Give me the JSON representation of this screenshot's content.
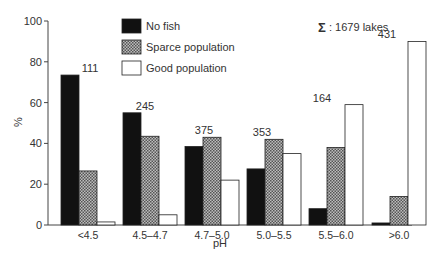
{
  "chart_data": {
    "type": "bar",
    "title": "",
    "xlabel": "pH",
    "ylabel": "%",
    "ylim": [
      0,
      100
    ],
    "yticks": [
      0,
      20,
      40,
      60,
      80,
      100
    ],
    "categories": [
      "<4.5",
      "4.5–4.7",
      "4.7–5.0",
      "5.0–5.5",
      "5.5–6.0",
      ">6.0"
    ],
    "group_totals": [
      111,
      245,
      375,
      353,
      164,
      431
    ],
    "series": [
      {
        "name": "No fish",
        "fill": "#111111",
        "pattern": "solid",
        "values": [
          73.5,
          55,
          38.5,
          27.5,
          8,
          1
        ]
      },
      {
        "name": "Sparce population",
        "fill": "#888888",
        "pattern": "dotted",
        "values": [
          26.5,
          43.5,
          43,
          42,
          38,
          14
        ]
      },
      {
        "name": "Good population",
        "fill": "#ffffff",
        "pattern": "outline",
        "values": [
          1.5,
          5,
          22,
          35,
          59,
          90
        ]
      }
    ],
    "annotation": "Σ: 1679 lakes",
    "grid": false,
    "legend_position": "top-center"
  },
  "legend": {
    "items": [
      "No fish",
      "Sparce population",
      "Good population"
    ]
  },
  "annotation": {
    "sigma": "Σ",
    "text": ": 1679 lakes"
  },
  "axes": {
    "xlabel": "pH",
    "ylabel": "%"
  }
}
